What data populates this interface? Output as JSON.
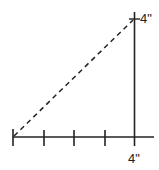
{
  "diagram": {
    "type": "right-triangle",
    "top_partial_label": "···",
    "vertical_label": "4\"",
    "horizontal_label": "4\"",
    "horizontal_ticks": 5,
    "line_color": "#222222",
    "hypotenuse_style": "dashed"
  }
}
